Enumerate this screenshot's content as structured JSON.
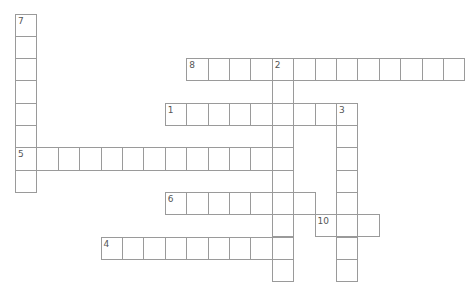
{
  "puzzle": {
    "type": "crossword",
    "origin": {
      "x": 15,
      "y": 13.5
    },
    "cell_size": {
      "w": 21.4,
      "h": 22.3
    },
    "colors": {
      "border": "#9a9a9a",
      "cell": "#ffffff",
      "number": "#555555"
    },
    "words": [
      {
        "number": "7",
        "direction": "down",
        "row": 0,
        "col": 0,
        "length": 8
      },
      {
        "number": "8",
        "direction": "across",
        "row": 2,
        "col": 8,
        "length": 13
      },
      {
        "number": "2",
        "direction": "down",
        "row": 2,
        "col": 12,
        "length": 10
      },
      {
        "number": "1",
        "direction": "across",
        "row": 4,
        "col": 7,
        "length": 9
      },
      {
        "number": "3",
        "direction": "down",
        "row": 4,
        "col": 15,
        "length": 8
      },
      {
        "number": "5",
        "direction": "across",
        "row": 6,
        "col": 0,
        "length": 13
      },
      {
        "number": "6",
        "direction": "across",
        "row": 8,
        "col": 7,
        "length": 7
      },
      {
        "number": "10",
        "direction": "across",
        "row": 9,
        "col": 14,
        "length": 3
      },
      {
        "number": "4",
        "direction": "across",
        "row": 10,
        "col": 4,
        "length": 9
      }
    ]
  }
}
